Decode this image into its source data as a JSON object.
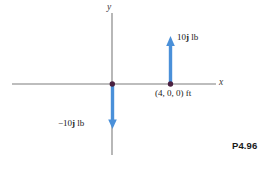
{
  "figure": {
    "reference_label": "P4.96",
    "axes": {
      "x_label": "x",
      "y_label": "y"
    },
    "labels": {
      "force_up": "10j lb",
      "force_down": "-10j lb",
      "point_coordinate": "(4, 0, 0) ft"
    },
    "colors": {
      "vector_blue": "#4a90d9",
      "axis_gray": "#7d7d7d",
      "point_dark": "#4a2040",
      "text_black": "#1a1a1a"
    }
  },
  "chart_data": {
    "type": "diagram",
    "title": "",
    "axis_origin_px": [
      112,
      84
    ],
    "xlabel": "x",
    "ylabel": "y",
    "points": [
      {
        "name": "origin",
        "coords": [
          0,
          0,
          0
        ],
        "label": "",
        "px": [
          112,
          84
        ]
      },
      {
        "name": "point-a",
        "coords": [
          4,
          0,
          0
        ],
        "label": "(4, 0, 0) ft",
        "px": [
          170,
          84
        ]
      }
    ],
    "vectors": [
      {
        "name": "force-up",
        "at": [
          4,
          0,
          0
        ],
        "components": [
          0,
          10,
          0
        ],
        "magnitude": 10,
        "units": "lb",
        "label": "10j lb",
        "direction": "up"
      },
      {
        "name": "force-down",
        "at": [
          0,
          0,
          0
        ],
        "components": [
          0,
          -10,
          0
        ],
        "magnitude": 10,
        "units": "lb",
        "label": "-10j lb",
        "direction": "down"
      }
    ],
    "grid": false,
    "legend": false
  }
}
